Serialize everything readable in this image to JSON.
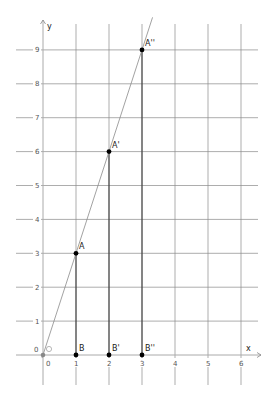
{
  "axes": {
    "x_label": "x",
    "y_label": "y",
    "origin_label": "0",
    "x_ticks": [
      "0",
      "1",
      "2",
      "3",
      "4",
      "5",
      "6"
    ],
    "y_ticks": [
      "1",
      "2",
      "3",
      "4",
      "5",
      "6",
      "7",
      "8",
      "9"
    ],
    "origin_point_label": "O"
  },
  "points": [
    {
      "name": "A",
      "x": 1,
      "y": 3
    },
    {
      "name": "A'",
      "x": 2,
      "y": 6
    },
    {
      "name": "A''",
      "x": 3,
      "y": 9
    },
    {
      "name": "B",
      "x": 1,
      "y": 0
    },
    {
      "name": "B'",
      "x": 2,
      "y": 0
    },
    {
      "name": "B''",
      "x": 3,
      "y": 0
    }
  ],
  "line": {
    "equation": "y = 3x",
    "through": [
      "O",
      "A",
      "A'",
      "A''"
    ]
  },
  "colors": {
    "grid": "#7a7a7a",
    "axis": "#9a9a9a",
    "point": "#000000",
    "line": "#888888"
  }
}
